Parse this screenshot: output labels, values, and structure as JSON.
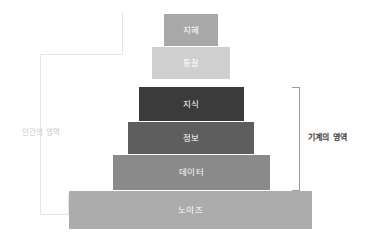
{
  "diagram": {
    "type": "stepped-pyramid",
    "background_color": "#ffffff",
    "layers": [
      {
        "label": "지혜",
        "level": 1,
        "color": "#a8a8a8",
        "text_color": "#ffffff",
        "left": 164,
        "top": 14,
        "width": 54,
        "height": 32
      },
      {
        "label": "통찰",
        "level": 2,
        "color": "#cfcfcf",
        "text_color": "#ffffff",
        "left": 152,
        "top": 47,
        "width": 78,
        "height": 32
      },
      {
        "label": "지식",
        "level": 3,
        "color": "#3b3b3b",
        "text_color": "#ffffff",
        "left": 139,
        "top": 87,
        "width": 105,
        "height": 34
      },
      {
        "label": "정보",
        "level": 4,
        "color": "#5e5e5e",
        "text_color": "#ffffff",
        "left": 128,
        "top": 122,
        "width": 126,
        "height": 32
      },
      {
        "label": "데이터",
        "level": 5,
        "color": "#8a8a8a",
        "text_color": "#ffffff",
        "left": 113,
        "top": 155,
        "width": 157,
        "height": 35
      },
      {
        "label": "노이즈",
        "level": 6,
        "color": "#acacac",
        "text_color": "#ffffff",
        "left": 69,
        "top": 191,
        "width": 243,
        "height": 38
      }
    ],
    "annotations": {
      "left": {
        "label": "인간의 영역",
        "color": "#c9c9c9",
        "bracket_color": "#e6e6e6"
      },
      "right": {
        "label": "기계의 영역",
        "color": "#3d3d3d",
        "bracket_color": "#9a9a9a"
      }
    }
  }
}
